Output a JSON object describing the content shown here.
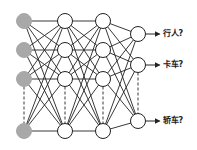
{
  "diagram": {
    "type": "neural-network",
    "colors": {
      "input_node_fill": "#a8a8a8",
      "hidden_node_fill": "#ffffff",
      "stroke": "#222222",
      "background": "#ffffff"
    },
    "layers": [
      {
        "name": "input",
        "x": 24,
        "nodes_y": [
          21,
          50,
          79,
          131
        ],
        "ellipsis_between": [
          2,
          3
        ]
      },
      {
        "name": "hidden-1",
        "x": 65,
        "nodes_y": [
          21,
          50,
          79,
          131
        ],
        "ellipsis_between": [
          2,
          3
        ]
      },
      {
        "name": "hidden-2",
        "x": 103,
        "nodes_y": [
          21,
          50,
          79,
          131
        ],
        "ellipsis_between": [
          2,
          3
        ]
      },
      {
        "name": "output",
        "x": 138,
        "nodes_y": [
          34,
          65,
          121
        ],
        "ellipsis_between": [
          1,
          2
        ]
      }
    ],
    "outputs": [
      {
        "label": "行人?",
        "y": 34
      },
      {
        "label": "卡车?",
        "y": 65
      },
      {
        "label": "轿车?",
        "y": 121
      }
    ]
  }
}
